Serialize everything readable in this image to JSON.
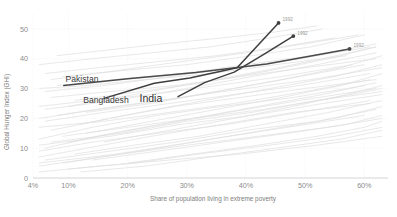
{
  "chart_data": {
    "type": "line",
    "title": "",
    "xlabel": "Share of population living in extreme poverty",
    "ylabel": "Global Hunger Index (GHI)",
    "xlim": [
      4,
      64
    ],
    "ylim": [
      0,
      55
    ],
    "xticks": [
      "4%",
      "10%",
      "20%",
      "30%",
      "40%",
      "50%",
      "60%"
    ],
    "xtick_values": [
      4,
      10,
      20,
      30,
      40,
      50,
      60
    ],
    "yticks": [
      "0",
      "10",
      "20",
      "30",
      "40",
      "50"
    ],
    "ytick_values": [
      0,
      10,
      20,
      30,
      40,
      50
    ],
    "grid": true,
    "legend": "none",
    "highlighted_series": [
      {
        "name": "Pakistan",
        "label": "Pakistan",
        "color": "#4a4a4a",
        "label_x": 9.5,
        "label_y": 32.2,
        "end_year": "1992",
        "points": [
          {
            "x": 9.2,
            "y": 31.0
          },
          {
            "x": 20.0,
            "y": 33.3
          },
          {
            "x": 31.5,
            "y": 35.4
          },
          {
            "x": 43.5,
            "y": 38.2
          },
          {
            "x": 57.5,
            "y": 43.3
          }
        ]
      },
      {
        "name": "Bangladesh",
        "label": "Bangladesh",
        "color": "#3f3f3f",
        "label_x": 12.5,
        "label_y": 25.0,
        "end_year": "1992",
        "points": [
          {
            "x": 16.0,
            "y": 26.7
          },
          {
            "x": 24.5,
            "y": 31.8
          },
          {
            "x": 30.5,
            "y": 33.5
          },
          {
            "x": 38.5,
            "y": 37.0
          },
          {
            "x": 45.5,
            "y": 52.0
          }
        ]
      },
      {
        "name": "India",
        "label": "India",
        "color": "#3f3f3f",
        "label_x": 22.0,
        "label_y": 25.4,
        "end_year": "1992",
        "points": [
          {
            "x": 28.5,
            "y": 27.3
          },
          {
            "x": 33.0,
            "y": 32.0
          },
          {
            "x": 38.0,
            "y": 35.5
          },
          {
            "x": 43.0,
            "y": 41.5
          },
          {
            "x": 48.0,
            "y": 47.6
          }
        ]
      }
    ],
    "background_series_color": "#dedede",
    "background_series": [
      [
        [
          5,
          4
        ],
        [
          12,
          6
        ],
        [
          22,
          9
        ],
        [
          34,
          13
        ],
        [
          47,
          17
        ],
        [
          60,
          21
        ]
      ],
      [
        [
          5,
          7
        ],
        [
          13,
          10
        ],
        [
          24,
          14
        ],
        [
          36,
          18
        ],
        [
          48,
          22
        ],
        [
          61,
          25
        ]
      ],
      [
        [
          6,
          10
        ],
        [
          15,
          14
        ],
        [
          26,
          18
        ],
        [
          37,
          22
        ],
        [
          49,
          26
        ],
        [
          62,
          30
        ]
      ],
      [
        [
          5,
          13
        ],
        [
          14,
          17
        ],
        [
          25,
          21
        ],
        [
          36,
          24
        ],
        [
          48,
          27
        ],
        [
          60,
          31
        ]
      ],
      [
        [
          7,
          16
        ],
        [
          17,
          20
        ],
        [
          28,
          24
        ],
        [
          39,
          27
        ],
        [
          50,
          30
        ],
        [
          62,
          33
        ]
      ],
      [
        [
          6,
          19
        ],
        [
          16,
          22
        ],
        [
          27,
          25
        ],
        [
          38,
          28
        ],
        [
          49,
          31
        ],
        [
          61,
          35
        ]
      ],
      [
        [
          8,
          21
        ],
        [
          18,
          24
        ],
        [
          29,
          27
        ],
        [
          40,
          30
        ],
        [
          51,
          33
        ],
        [
          63,
          37
        ]
      ],
      [
        [
          5,
          2
        ],
        [
          15,
          4
        ],
        [
          27,
          6
        ],
        [
          39,
          8
        ],
        [
          52,
          11
        ],
        [
          63,
          14
        ]
      ],
      [
        [
          9,
          5
        ],
        [
          19,
          8
        ],
        [
          30,
          11
        ],
        [
          42,
          14
        ],
        [
          54,
          17
        ],
        [
          63,
          20
        ]
      ],
      [
        [
          5,
          24
        ],
        [
          14,
          26
        ],
        [
          24,
          28
        ],
        [
          35,
          31
        ],
        [
          46,
          34
        ],
        [
          58,
          38
        ]
      ],
      [
        [
          10,
          12
        ],
        [
          20,
          16
        ],
        [
          31,
          20
        ],
        [
          42,
          24
        ],
        [
          53,
          28
        ],
        [
          62,
          32
        ]
      ],
      [
        [
          6,
          6
        ],
        [
          17,
          9
        ],
        [
          28,
          12
        ],
        [
          40,
          16
        ],
        [
          52,
          19
        ],
        [
          62,
          23
        ]
      ],
      [
        [
          12,
          18
        ],
        [
          22,
          22
        ],
        [
          33,
          26
        ],
        [
          44,
          30
        ],
        [
          55,
          34
        ],
        [
          63,
          38
        ]
      ],
      [
        [
          5,
          30
        ],
        [
          13,
          31
        ],
        [
          23,
          33
        ],
        [
          34,
          35
        ],
        [
          45,
          38
        ],
        [
          57,
          41
        ]
      ],
      [
        [
          7,
          27
        ],
        [
          17,
          29
        ],
        [
          28,
          31
        ],
        [
          39,
          34
        ],
        [
          50,
          37
        ],
        [
          62,
          40
        ]
      ],
      [
        [
          11,
          8
        ],
        [
          21,
          11
        ],
        [
          32,
          14
        ],
        [
          43,
          18
        ],
        [
          54,
          22
        ],
        [
          63,
          26
        ]
      ],
      [
        [
          5,
          17
        ],
        [
          16,
          19
        ],
        [
          27,
          22
        ],
        [
          38,
          25
        ],
        [
          50,
          29
        ],
        [
          61,
          33
        ]
      ],
      [
        [
          9,
          14
        ],
        [
          20,
          17
        ],
        [
          31,
          20
        ],
        [
          43,
          23
        ],
        [
          55,
          27
        ],
        [
          63,
          30
        ]
      ],
      [
        [
          6,
          35
        ],
        [
          15,
          37
        ],
        [
          25,
          39
        ],
        [
          35,
          41
        ],
        [
          46,
          44
        ],
        [
          55,
          47
        ]
      ],
      [
        [
          13,
          22
        ],
        [
          24,
          25
        ],
        [
          35,
          29
        ],
        [
          46,
          33
        ],
        [
          56,
          37
        ],
        [
          63,
          41
        ]
      ],
      [
        [
          5,
          9
        ],
        [
          14,
          12
        ],
        [
          25,
          15
        ],
        [
          37,
          18
        ],
        [
          49,
          22
        ],
        [
          61,
          26
        ]
      ],
      [
        [
          8,
          31
        ],
        [
          18,
          33
        ],
        [
          29,
          35
        ],
        [
          40,
          38
        ],
        [
          51,
          41
        ],
        [
          62,
          45
        ]
      ],
      [
        [
          10,
          3
        ],
        [
          21,
          5
        ],
        [
          32,
          8
        ],
        [
          44,
          11
        ],
        [
          55,
          14
        ],
        [
          63,
          17
        ]
      ],
      [
        [
          6,
          23
        ],
        [
          18,
          26
        ],
        [
          30,
          30
        ],
        [
          41,
          34
        ],
        [
          52,
          38
        ],
        [
          62,
          42
        ]
      ],
      [
        [
          14,
          6
        ],
        [
          25,
          9
        ],
        [
          36,
          12
        ],
        [
          47,
          15
        ],
        [
          57,
          18
        ],
        [
          63,
          21
        ]
      ],
      [
        [
          5,
          38
        ],
        [
          14,
          40
        ],
        [
          24,
          42
        ],
        [
          34,
          44
        ],
        [
          44,
          47
        ],
        [
          53,
          50
        ]
      ],
      [
        [
          7,
          12
        ],
        [
          19,
          15
        ],
        [
          30,
          19
        ],
        [
          41,
          22
        ],
        [
          52,
          26
        ],
        [
          63,
          29
        ]
      ],
      [
        [
          11,
          26
        ],
        [
          22,
          29
        ],
        [
          33,
          32
        ],
        [
          44,
          36
        ],
        [
          54,
          40
        ],
        [
          62,
          44
        ]
      ],
      [
        [
          5,
          20
        ],
        [
          15,
          23
        ],
        [
          26,
          26
        ],
        [
          38,
          30
        ],
        [
          49,
          34
        ],
        [
          60,
          38
        ]
      ],
      [
        [
          9,
          34
        ],
        [
          19,
          36
        ],
        [
          30,
          38
        ],
        [
          41,
          41
        ],
        [
          51,
          44
        ],
        [
          60,
          48
        ]
      ],
      [
        [
          12,
          2
        ],
        [
          23,
          4
        ],
        [
          34,
          7
        ],
        [
          45,
          10
        ],
        [
          56,
          13
        ],
        [
          63,
          16
        ]
      ],
      [
        [
          6,
          29
        ],
        [
          16,
          31
        ],
        [
          27,
          34
        ],
        [
          38,
          37
        ],
        [
          49,
          40
        ],
        [
          61,
          44
        ]
      ],
      [
        [
          16,
          12
        ],
        [
          27,
          16
        ],
        [
          38,
          20
        ],
        [
          48,
          24
        ],
        [
          57,
          28
        ],
        [
          63,
          31
        ]
      ],
      [
        [
          5,
          5
        ],
        [
          18,
          8
        ],
        [
          31,
          12
        ],
        [
          43,
          16
        ],
        [
          55,
          20
        ],
        [
          63,
          24
        ]
      ],
      [
        [
          8,
          41
        ],
        [
          17,
          43
        ],
        [
          26,
          45
        ],
        [
          36,
          47
        ],
        [
          45,
          49
        ],
        [
          52,
          51
        ]
      ],
      [
        [
          13,
          15
        ],
        [
          24,
          19
        ],
        [
          35,
          23
        ],
        [
          46,
          27
        ],
        [
          56,
          31
        ],
        [
          63,
          35
        ]
      ],
      [
        [
          20,
          5
        ],
        [
          31,
          8
        ],
        [
          42,
          11
        ],
        [
          52,
          14
        ],
        [
          60,
          17
        ],
        [
          63,
          19
        ]
      ],
      [
        [
          7,
          33
        ],
        [
          18,
          36
        ],
        [
          29,
          39
        ],
        [
          40,
          42
        ],
        [
          50,
          45
        ],
        [
          59,
          48
        ]
      ],
      [
        [
          5,
          11
        ],
        [
          17,
          14
        ],
        [
          29,
          18
        ],
        [
          41,
          21
        ],
        [
          53,
          25
        ],
        [
          63,
          28
        ]
      ],
      [
        [
          10,
          24
        ],
        [
          21,
          28
        ],
        [
          32,
          32
        ],
        [
          43,
          36
        ],
        [
          53,
          40
        ],
        [
          62,
          44
        ]
      ]
    ]
  }
}
